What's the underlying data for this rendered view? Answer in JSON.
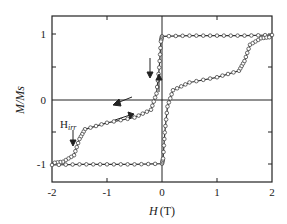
{
  "chart_data": {
    "type": "line",
    "title": "",
    "xlabel": "H (T)",
    "ylabel": "M/Ms",
    "xlim": [
      -2,
      2
    ],
    "ylim": [
      -1.25,
      1.25
    ],
    "x_ticks": [
      "-2",
      "-1",
      "0",
      "1",
      "2"
    ],
    "y_ticks": [
      "-1",
      "0",
      "1"
    ],
    "grid": false,
    "annotations": [
      "H_irr",
      "arrows indicating sweep direction"
    ],
    "series": [
      {
        "name": "descending branch",
        "points": [
          [
            2,
            1.0
          ],
          [
            1.5,
            0.99
          ],
          [
            1,
            0.99
          ],
          [
            0.5,
            0.99
          ],
          [
            0,
            0.98
          ],
          [
            -0.02,
            0.9
          ],
          [
            -0.05,
            0.5
          ],
          [
            -0.1,
            0.1
          ],
          [
            -0.2,
            -0.15
          ],
          [
            -0.5,
            -0.27
          ],
          [
            -1,
            -0.35
          ],
          [
            -1.4,
            -0.45
          ],
          [
            -1.5,
            -0.6
          ],
          [
            -1.6,
            -0.85
          ],
          [
            -1.8,
            -0.95
          ],
          [
            -2,
            -0.97
          ]
        ]
      },
      {
        "name": "ascending branch",
        "points": [
          [
            -2,
            -1.0
          ],
          [
            -1.5,
            -0.99
          ],
          [
            -1,
            -0.99
          ],
          [
            -0.5,
            -0.99
          ],
          [
            0,
            -0.98
          ],
          [
            0.02,
            -0.9
          ],
          [
            0.05,
            -0.5
          ],
          [
            0.1,
            -0.1
          ],
          [
            0.2,
            0.15
          ],
          [
            0.5,
            0.27
          ],
          [
            1,
            0.35
          ],
          [
            1.4,
            0.45
          ],
          [
            1.5,
            0.6
          ],
          [
            1.6,
            0.85
          ],
          [
            1.8,
            0.95
          ],
          [
            2,
            0.97
          ]
        ]
      }
    ]
  },
  "labels": {
    "xlabel_H": "H",
    "xlabel_unit": "(T)",
    "ylabel": "M/Ms",
    "hirr_main": "H",
    "hirr_sub": "irr"
  }
}
